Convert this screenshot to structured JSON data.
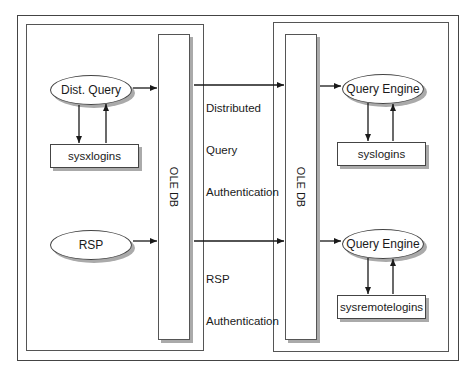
{
  "diagram": {
    "left_server": {
      "ole_db_label": "OLE DB",
      "dist_query": "Dist. Query",
      "sysxlogins": "sysxlogins",
      "rsp": "RSP"
    },
    "right_server": {
      "ole_db_label": "OLE DB",
      "query_engine_top": "Query Engine",
      "syslogins": "syslogins",
      "query_engine_bottom": "Query Engine",
      "sysremotelogins": "sysremotelogins"
    },
    "connections": {
      "distributed_label_line1": "Distributed",
      "distributed_label_line2": "Query",
      "distributed_label_line3": "Authentication",
      "rsp_label_line1": "RSP",
      "rsp_label_line2": "Authentication"
    }
  }
}
